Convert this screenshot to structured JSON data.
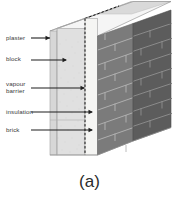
{
  "figure": {
    "caption": "(a)",
    "background_color": "#ffffff"
  },
  "labels": [
    {
      "id": "plaster",
      "text": "plaster",
      "arrow": "right-arrow-icon"
    },
    {
      "id": "block",
      "text": "block",
      "arrow": "right-arrow-icon"
    },
    {
      "id": "vapour",
      "text": "vapour\nbarrier",
      "arrow": "right-arrow-icon"
    },
    {
      "id": "insulation",
      "text": "insulation",
      "arrow": "right-arrow-icon"
    },
    {
      "id": "brick",
      "text": "brick",
      "arrow": "right-arrow-icon"
    }
  ],
  "wall_layers": [
    {
      "name": "plaster",
      "color": "#d9d9d9"
    },
    {
      "name": "block",
      "color": "#dedede"
    },
    {
      "name": "vapour barrier",
      "color": "#000000"
    },
    {
      "name": "insulation",
      "color": "#f4f4f2"
    },
    {
      "name": "brick",
      "color": "#7b7b7b"
    }
  ],
  "colors": {
    "brick_front": "#7b7b7b",
    "brick_side": "#5c5c5c",
    "brick_mortar": "#b9b9b9",
    "top_face_light": "#ececec",
    "top_face_mid": "#d7d7d7",
    "top_face_dark": "#bdbdbd",
    "outline": "#9a9a9a",
    "arrow": "#1f1f1f",
    "text": "#3a3a3a"
  }
}
